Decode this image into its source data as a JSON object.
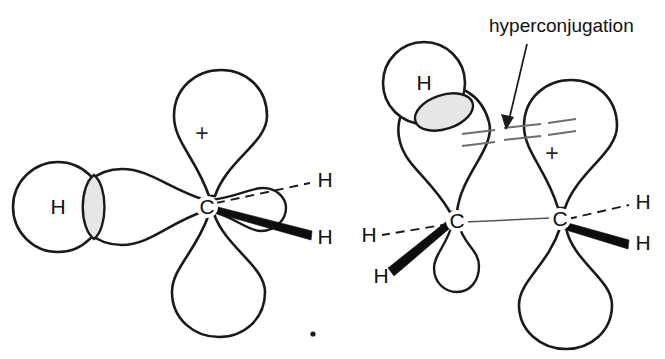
{
  "figure": {
    "background_color": "#ffffff",
    "ink_color": "#1a1a1a",
    "shade_color": "#e6e6e6",
    "hyper_line_color": "#6e6e6e"
  },
  "annotation": {
    "callout_label": "hyperconjugation",
    "pointer_from_x": 527,
    "pointer_from_y": 44,
    "pointer_to_x": 506,
    "pointer_to_y": 128
  },
  "left_structure": {
    "name": "methyl-cation-hyperconjugation",
    "center_atom": "C",
    "charge_symbol": "+",
    "hydrogen_sphere_label": "H",
    "dashed_hydrogen_label": "H",
    "wedge_hydrogen_label": "H",
    "lobes": [
      {
        "id": "top-lobe",
        "orientation": "up",
        "carries_charge": true
      },
      {
        "id": "bottom-lobe",
        "orientation": "down",
        "carries_charge": false
      },
      {
        "id": "left-lobe",
        "orientation": "left",
        "carries_charge": false
      },
      {
        "id": "right-lobe",
        "orientation": "right",
        "carries_charge": false
      }
    ],
    "overlap_region": "sigma-p-overlap-lens"
  },
  "right_structure": {
    "name": "ethyl-cation-hyperconjugation",
    "left_atom": "C",
    "right_atom": "C",
    "charge_symbol": "+",
    "hydrogen_sphere_label": "H",
    "left_dashed_hydrogen_label": "H",
    "left_wedge_hydrogen_label": "H",
    "right_dashed_hydrogen_label": "H",
    "right_wedge_hydrogen_label": "H",
    "lobes": [
      {
        "id": "left-c-upper-lobe",
        "orientation": "up-tilted",
        "carries_charge": false
      },
      {
        "id": "left-c-lower-lobe",
        "orientation": "down-small",
        "carries_charge": false
      },
      {
        "id": "right-c-upper-lobe",
        "orientation": "up",
        "carries_charge": true
      },
      {
        "id": "right-c-lower-lobe",
        "orientation": "down",
        "carries_charge": false
      }
    ],
    "overlap_region": "sigma-p-overlap-ellipse",
    "hyperconjugation_marks": 4
  },
  "artifact": {
    "speck_label": ".",
    "speck_x": 313,
    "speck_y": 334
  }
}
